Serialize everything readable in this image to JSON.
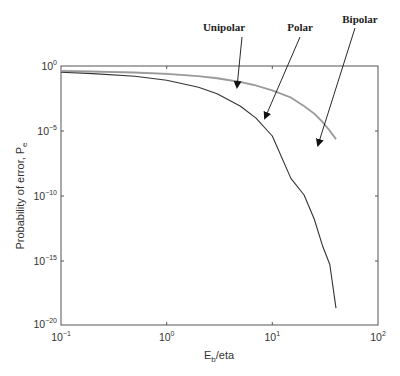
{
  "chart_data": {
    "type": "line",
    "title": "",
    "xlabel": "E_b/eta",
    "ylabel": "Probability of error, P_e",
    "xscale": "log",
    "yscale": "log",
    "xlim": [
      0.1,
      100
    ],
    "ylim": [
      1e-20,
      1
    ],
    "x_ticks": [
      {
        "base": "10",
        "exp": "-1",
        "value": 0.1
      },
      {
        "base": "10",
        "exp": "0",
        "value": 1
      },
      {
        "base": "10",
        "exp": "1",
        "value": 10
      },
      {
        "base": "10",
        "exp": "2",
        "value": 100
      }
    ],
    "y_ticks": [
      {
        "base": "10",
        "exp": "0",
        "value": 1
      },
      {
        "base": "10",
        "exp": "-5",
        "value": 1e-05
      },
      {
        "base": "10",
        "exp": "-10",
        "value": 1e-10
      },
      {
        "base": "10",
        "exp": "-15",
        "value": 1e-15
      },
      {
        "base": "10",
        "exp": "-20",
        "value": 1e-20
      }
    ],
    "grid": false,
    "legend": "annotations with arrows",
    "x": [
      0.1,
      0.2,
      0.5,
      1,
      2,
      3,
      5,
      7,
      10,
      15,
      20,
      25,
      30,
      35,
      40
    ],
    "series": [
      {
        "name": "Unipolar",
        "color": "#9a9a9a",
        "values": [
          0.41,
          0.37,
          0.31,
          0.24,
          0.16,
          0.11,
          0.057,
          0.031,
          0.013,
          0.0036,
          0.00078,
          0.0002,
          4.5e-05,
          9.8e-06,
          2.2e-06
        ]
      },
      {
        "name": "Bipolar",
        "color": "#c4c4c4",
        "values": [
          0.44,
          0.4,
          0.33,
          0.26,
          0.17,
          0.12,
          0.06,
          0.032,
          0.0135,
          0.0037,
          0.0008,
          0.00021,
          4.8e-05,
          1.05e-05,
          2.4e-06
        ]
      },
      {
        "name": "Polar",
        "color": "#333333",
        "values": [
          0.33,
          0.26,
          0.16,
          0.079,
          0.023,
          0.0072,
          0.00078,
          9.4e-05,
          3.9e-06,
          2.1e-09,
          1.1e-10,
          1.4e-12,
          1.2e-14,
          4.7e-16,
          2e-19
        ]
      }
    ],
    "annotations": [
      {
        "label": "Unipolar",
        "points_to_series": "Unipolar"
      },
      {
        "label": "Polar",
        "points_to_series": "Polar"
      },
      {
        "label": "Bipolar",
        "points_to_series": "Bipolar"
      }
    ]
  },
  "axes": {
    "xlabel_main": "E",
    "xlabel_sub": "b",
    "xlabel_rest": "/eta",
    "ylabel_main": "Probability of error, P",
    "ylabel_sub": "e"
  },
  "annotations": {
    "unipolar": "Unipolar",
    "polar": "Polar",
    "bipolar": "Bipolar"
  },
  "ticks": {
    "x": [
      {
        "base": "10",
        "exp": "−1"
      },
      {
        "base": "10",
        "exp": "0"
      },
      {
        "base": "10",
        "exp": "1"
      },
      {
        "base": "10",
        "exp": "2"
      }
    ],
    "y": [
      {
        "base": "10",
        "exp": "0"
      },
      {
        "base": "10",
        "exp": "−5"
      },
      {
        "base": "10",
        "exp": "−10"
      },
      {
        "base": "10",
        "exp": "−15"
      },
      {
        "base": "10",
        "exp": "−20"
      }
    ]
  }
}
